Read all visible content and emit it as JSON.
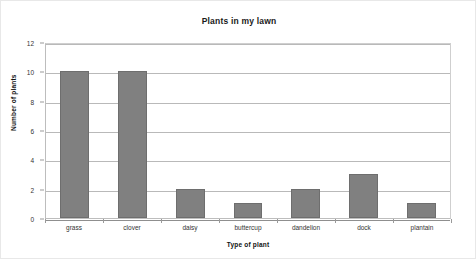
{
  "chart_data": {
    "type": "bar",
    "title": "Plants in my lawn",
    "xlabel": "Type of plant",
    "ylabel": "Number of plants",
    "categories": [
      "grass",
      "clover",
      "daisy",
      "buttercup",
      "dandelion",
      "dock",
      "plantain"
    ],
    "values": [
      10,
      10,
      2,
      1,
      2,
      3,
      1
    ],
    "ylim": [
      0,
      12
    ],
    "ytick_step": 2,
    "yticks": [
      0,
      2,
      4,
      6,
      8,
      10,
      12
    ],
    "ytick_labels": [
      "0",
      "2",
      "4",
      "6",
      "8",
      "10",
      "12"
    ],
    "grid": "horizontal",
    "legend": "none",
    "bar_color": "#808080",
    "bar_border_color": "#6e6e6e",
    "gridline_color": "#b9b9b9",
    "background": "#ffffff"
  }
}
